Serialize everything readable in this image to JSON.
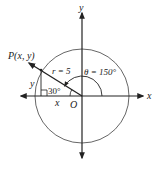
{
  "figure": {
    "colors": {
      "ink": "#222222",
      "circle": "#555555",
      "background": "#ffffff"
    },
    "axes": {
      "x_label": "x",
      "y_label": "y",
      "origin_label": "O"
    },
    "point": {
      "label": "P(x, y)"
    },
    "radius_label": "r = 5",
    "angle_label": "θ = 150°",
    "reference_angle_label": "30°",
    "leg_labels": {
      "horizontal": "x",
      "vertical": "y"
    }
  }
}
